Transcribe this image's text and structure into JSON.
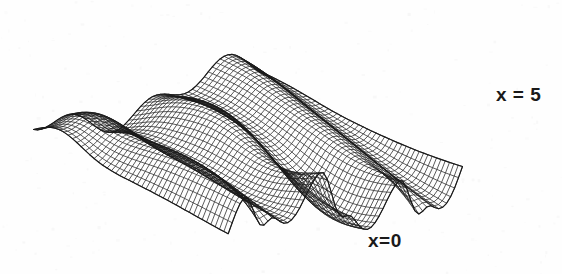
{
  "figure": {
    "type": "surface-wireframe-plot",
    "background_color": "#fefefe",
    "line_color": "#1a1a1a"
  },
  "labels": {
    "right": "x = 5",
    "bottom": "x=0"
  },
  "chart_data": {
    "type": "surface",
    "title": "",
    "xlabel": "",
    "ylabel": "",
    "zlabel": "",
    "annotations": [
      {
        "text": "x = 5",
        "position": "right-edge",
        "x_px": 496,
        "y_px": 84
      },
      {
        "text": "x=0",
        "position": "front-edge",
        "x_px": 368,
        "y_px": 230
      }
    ],
    "axis_ranges": {
      "x": [
        0,
        5
      ],
      "t": [
        0,
        1
      ],
      "z": [
        -1,
        1
      ]
    },
    "grid": {
      "nx": 60,
      "nt": 46,
      "visible": true
    },
    "projection": {
      "kind": "oblique-isometric",
      "origin_px": [
        248,
        150
      ],
      "u_axis_px": [
        3.55,
        -1.02
      ],
      "v_axis_px": [
        -2.95,
        -1.52
      ],
      "z_scale_px": 46
    },
    "surface_formula": "z(x,t) = 0.55*sin(2*pi*x/5*3 - 1.6*t) * exp(-0.9*t) + 0.42*sin(2*pi*x/5*1.0) * cos(2.3*t) - 0.30*exp(-24*((x/5)-0.5)^2)*sin(7.5*t)",
    "features": [
      "three sharp downward spikes along the front (x=0) edge",
      "a tall folded ridge along the upper-left back edge",
      "broad wave troughs running diagonally across the sheet",
      "a flared cusp at the far left corner"
    ],
    "sampled_front_edge_z": [
      0.1,
      0.34,
      0.55,
      0.28,
      -0.72,
      -0.15,
      0.4,
      0.62,
      0.22,
      -0.8,
      -0.22,
      0.35,
      0.58,
      0.18,
      -0.85,
      -0.1,
      0.3
    ],
    "sampled_back_edge_z": [
      0.05,
      0.4,
      0.78,
      0.92,
      0.6,
      0.18,
      0.45,
      0.8,
      0.7,
      0.3,
      0.12,
      0.48,
      0.74,
      0.55,
      0.2,
      0.08,
      0.15
    ]
  }
}
